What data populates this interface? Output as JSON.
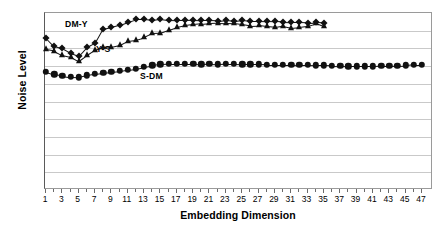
{
  "chart_data": {
    "type": "line",
    "title": "",
    "xlabel": "Embedding Dimension",
    "ylabel": "Noise Level",
    "xlim": [
      1,
      47
    ],
    "ylim": [
      0.0,
      50.0
    ],
    "grid": true,
    "legend": "inline-annotations",
    "y_ticks": [
      "0.0",
      "5.0",
      "10.0",
      "15.0",
      "20.0",
      "25.0",
      "30.0",
      "35.0",
      "40.0",
      "45.0",
      "50.0"
    ],
    "x_ticks": [
      "1",
      "3",
      "5",
      "7",
      "9",
      "11",
      "13",
      "15",
      "17",
      "19",
      "21",
      "23",
      "25",
      "27",
      "29",
      "31",
      "33",
      "35",
      "37",
      "39",
      "41",
      "43",
      "45",
      "47"
    ],
    "x": [
      1,
      2,
      3,
      4,
      5,
      6,
      7,
      8,
      9,
      10,
      11,
      12,
      13,
      14,
      15,
      16,
      17,
      18,
      19,
      20,
      21,
      22,
      23,
      24,
      25,
      26,
      27,
      28,
      29,
      30,
      31,
      32,
      33,
      34,
      35,
      36,
      37,
      38,
      39,
      40,
      41,
      42,
      43,
      44,
      45,
      46,
      47
    ],
    "series": [
      {
        "name": "DM-Y",
        "marker": "diamond",
        "annotation": "DM-Y",
        "values": [
          43.0,
          40.6,
          40.0,
          38.7,
          37.8,
          40.3,
          41.5,
          45.6,
          46.1,
          46.7,
          47.5,
          48.2,
          48.2,
          48.0,
          48.3,
          48.0,
          47.9,
          47.9,
          48.0,
          47.9,
          47.9,
          47.8,
          48.0,
          47.8,
          48.0,
          47.8,
          47.8,
          47.7,
          47.6,
          47.5,
          47.4,
          47.4,
          47.3,
          47.4,
          47.3,
          null,
          null,
          null,
          null,
          null,
          null,
          null,
          null,
          null,
          null,
          null,
          null
        ]
      },
      {
        "name": "Y-S",
        "marker": "triangle",
        "annotation": "Y-S",
        "values": [
          39.7,
          39.3,
          38.1,
          37.6,
          36.3,
          38.0,
          39.5,
          40.3,
          40.5,
          41.0,
          42.2,
          42.5,
          43.2,
          44.3,
          44.4,
          45.2,
          46.0,
          46.5,
          46.8,
          47.0,
          47.2,
          47.3,
          47.2,
          47.1,
          46.8,
          46.4,
          46.5,
          46.2,
          46.0,
          46.4,
          45.9,
          46.1,
          46.4,
          47.1,
          46.2,
          null,
          null,
          null,
          null,
          null,
          null,
          null,
          null,
          null,
          null,
          null,
          null
        ]
      },
      {
        "name": "S-DM",
        "marker": "circle",
        "annotation": "S-DM",
        "values": [
          33.4,
          32.7,
          32.3,
          31.9,
          31.8,
          32.4,
          32.8,
          33.1,
          33.4,
          33.6,
          34.0,
          34.3,
          34.8,
          35.2,
          35.5,
          35.6,
          35.6,
          35.6,
          35.6,
          35.5,
          35.6,
          35.5,
          35.6,
          35.6,
          35.5,
          35.5,
          35.5,
          35.4,
          35.4,
          35.4,
          35.4,
          35.3,
          35.3,
          35.2,
          35.2,
          35.1,
          35.0,
          34.9,
          34.9,
          34.9,
          34.9,
          35.0,
          35.0,
          35.1,
          35.2,
          35.4,
          35.4
        ]
      }
    ]
  }
}
